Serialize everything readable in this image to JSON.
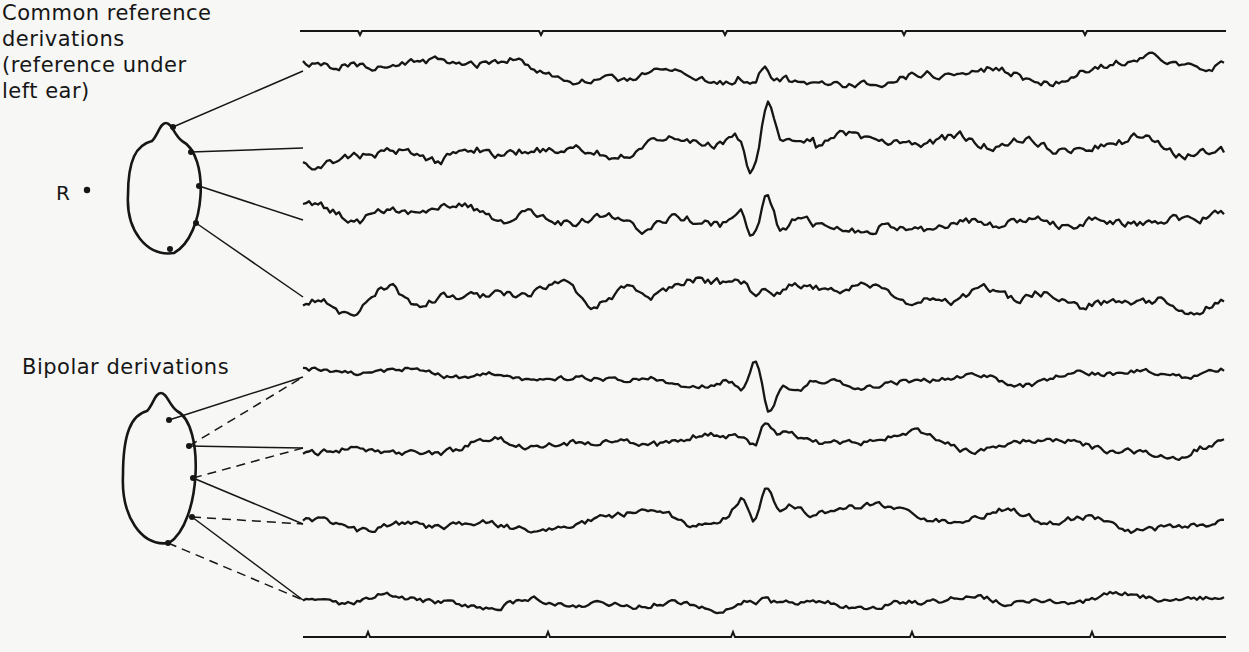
{
  "figure": {
    "type": "EEG montage comparison",
    "colors": {
      "ink": "#161616",
      "paper": "#f7f7f5"
    }
  },
  "labels": {
    "common_reference": "Common reference\nderivations\n(reference under\nleft ear)",
    "bipolar": "Bipolar derivations",
    "reference_marker": "R"
  },
  "head_diagrams": [
    {
      "name": "common-reference-head",
      "cx": 166,
      "cy": 195,
      "rx": 38,
      "ry": 58,
      "electrodes": [
        [
          173,
          127
        ],
        [
          191,
          152
        ],
        [
          199,
          186
        ],
        [
          196,
          223
        ],
        [
          170,
          249
        ]
      ],
      "connections": [
        {
          "from": 0,
          "to_y": 71,
          "style": "solid"
        },
        {
          "from": 1,
          "to_y": 148,
          "style": "solid"
        },
        {
          "from": 2,
          "to_y": 220,
          "style": "solid"
        },
        {
          "from": 3,
          "to_y": 297,
          "style": "solid"
        }
      ]
    },
    {
      "name": "bipolar-head",
      "cx": 161,
      "cy": 475,
      "rx": 38,
      "ry": 68,
      "electrodes": [
        [
          169,
          420
        ],
        [
          189,
          446
        ],
        [
          193,
          478
        ],
        [
          192,
          517
        ],
        [
          168,
          543
        ]
      ],
      "connections": [
        {
          "from": 0,
          "to_y": 377,
          "style": "solid"
        },
        {
          "from": 1,
          "to_y": 377,
          "style": "dashed"
        },
        {
          "from": 1,
          "to_y": 448,
          "style": "solid"
        },
        {
          "from": 2,
          "to_y": 448,
          "style": "dashed"
        },
        {
          "from": 2,
          "to_y": 524,
          "style": "solid"
        },
        {
          "from": 3,
          "to_y": 524,
          "style": "dashed"
        },
        {
          "from": 3,
          "to_y": 600,
          "style": "solid"
        },
        {
          "from": 4,
          "to_y": 600,
          "style": "dashed"
        }
      ]
    }
  ],
  "timing_lines": [
    {
      "name": "top-time-marker",
      "y": 31,
      "x_start": 300,
      "x_end": 1226,
      "ticks": [
        360,
        541,
        725,
        904,
        1085
      ],
      "tick_direction": "down"
    },
    {
      "name": "bottom-time-marker",
      "y": 637,
      "x_start": 303,
      "x_end": 1226,
      "ticks": [
        368,
        548,
        733,
        912,
        1092
      ],
      "tick_direction": "up"
    }
  ],
  "traces": [
    {
      "group": "common-reference",
      "channel": 1,
      "baseline": 72,
      "amp": 7,
      "seed": 11,
      "spike": {
        "x": 758,
        "amp": 8,
        "width": 14
      },
      "drift": 10
    },
    {
      "group": "common-reference",
      "channel": 2,
      "baseline": 150,
      "amp": 8,
      "seed": 23,
      "spike": {
        "x": 760,
        "amp": 32,
        "width": 18
      },
      "drift": 8
    },
    {
      "group": "common-reference",
      "channel": 3,
      "baseline": 219,
      "amp": 8,
      "seed": 37,
      "spike": {
        "x": 760,
        "amp": 24,
        "width": 16
      },
      "drift": 8
    },
    {
      "group": "common-reference",
      "channel": 4,
      "baseline": 296,
      "amp": 8,
      "seed": 41,
      "spike": {
        "x": 760,
        "amp": 6,
        "width": 12
      },
      "drift": 8
    },
    {
      "group": "bipolar",
      "channel": 1,
      "baseline": 375,
      "amp": 5,
      "seed": 53,
      "spike": {
        "x": 762,
        "amp": -24,
        "width": 16
      },
      "drift": 8
    },
    {
      "group": "bipolar",
      "channel": 2,
      "baseline": 446,
      "amp": 6,
      "seed": 67,
      "spike": {
        "x": 760,
        "amp": 10,
        "width": 12
      },
      "drift": 8
    },
    {
      "group": "bipolar",
      "channel": 3,
      "baseline": 519,
      "amp": 6,
      "seed": 79,
      "spike": {
        "x": 760,
        "amp": 20,
        "width": 14
      },
      "drift": 8
    },
    {
      "group": "bipolar",
      "channel": 4,
      "baseline": 601,
      "amp": 5,
      "seed": 97,
      "spike": {
        "x": 760,
        "amp": 6,
        "width": 10
      },
      "drift": 4
    }
  ],
  "trace_range": {
    "x_start": 303,
    "x_end": 1226
  }
}
